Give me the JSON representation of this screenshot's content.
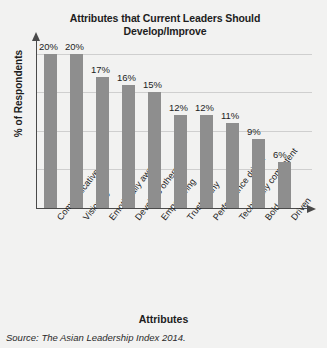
{
  "chart_data": {
    "type": "bar",
    "title": "Attributes that Current Leaders Should Develop/Improve",
    "title_line1": "Attributes that Current Leaders Should",
    "title_line2": "Develop/Improve",
    "xlabel": "Attributes",
    "ylabel": "% of Respondents",
    "categories": [
      "Communicative",
      "Visionary",
      "Emotionally aware",
      "Develops others",
      "Empowering",
      "Trustworthy",
      "Performance driven",
      "Technically competent",
      "Bold",
      "Driven"
    ],
    "values": [
      20,
      20,
      17,
      16,
      15,
      12,
      12,
      11,
      9,
      6
    ],
    "value_labels": [
      "20%",
      "20%",
      "17%",
      "16%",
      "15%",
      "12%",
      "12%",
      "11%",
      "9%",
      "6%"
    ],
    "ylim": [
      0,
      21
    ],
    "grid": true,
    "gridlines": [
      5,
      10,
      15,
      20
    ],
    "legend": "none",
    "bar_color": "#8e8e8e",
    "axis_color": "#4a4a4a",
    "grid_color": "#cfcfcf",
    "background": "#f2f2f1"
  },
  "source": "Source: The Asian Leadership Index 2014."
}
